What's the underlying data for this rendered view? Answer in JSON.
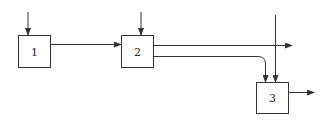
{
  "diagram": {
    "type": "block-flow",
    "line_color": "#333333",
    "nodes": [
      {
        "id": "1",
        "label": "1"
      },
      {
        "id": "2",
        "label": "2"
      },
      {
        "id": "3",
        "label": "3"
      }
    ],
    "edges": [
      {
        "from": "external",
        "to": "1",
        "description": "input arrow into block 1 from top"
      },
      {
        "from": "external",
        "to": "2",
        "description": "input arrow into block 2 from top"
      },
      {
        "from": "1",
        "to": "2",
        "description": "horizontal arrow from block 1 to block 2"
      },
      {
        "from": "2",
        "to": "external",
        "description": "upper output of block 2 exits right"
      },
      {
        "from": "2",
        "to": "3",
        "description": "lower output of block 2 curves down into block 3"
      },
      {
        "from": "external",
        "to": "3",
        "description": "vertical input into block 3 from top"
      },
      {
        "from": "3",
        "to": "external",
        "description": "output arrow from block 3 to the right"
      }
    ]
  }
}
